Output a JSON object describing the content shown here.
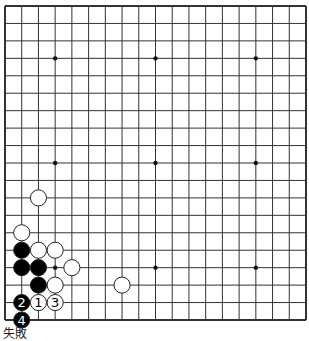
{
  "diagram": {
    "type": "go-board",
    "size": 19,
    "visible_region": "full board",
    "colors": {
      "board": "#ffffff",
      "line": "#333333",
      "black_stone": "#000000",
      "white_stone": "#ffffff",
      "stone_outline": "#222222"
    },
    "hoshi": [
      [
        3,
        3
      ],
      [
        9,
        3
      ],
      [
        15,
        3
      ],
      [
        3,
        9
      ],
      [
        9,
        9
      ],
      [
        15,
        9
      ],
      [
        3,
        15
      ],
      [
        9,
        15
      ],
      [
        15,
        15
      ]
    ],
    "stones": [
      {
        "col": 2,
        "row": 11,
        "color": "white",
        "label": ""
      },
      {
        "col": 1,
        "row": 13,
        "color": "white",
        "label": ""
      },
      {
        "col": 1,
        "row": 14,
        "color": "black",
        "label": ""
      },
      {
        "col": 2,
        "row": 14,
        "color": "white",
        "label": ""
      },
      {
        "col": 3,
        "row": 14,
        "color": "white",
        "label": ""
      },
      {
        "col": 1,
        "row": 15,
        "color": "black",
        "label": ""
      },
      {
        "col": 2,
        "row": 15,
        "color": "black",
        "label": ""
      },
      {
        "col": 4,
        "row": 15,
        "color": "white",
        "label": ""
      },
      {
        "col": 2,
        "row": 16,
        "color": "black",
        "label": ""
      },
      {
        "col": 3,
        "row": 16,
        "color": "white",
        "label": ""
      },
      {
        "col": 7,
        "row": 16,
        "color": "white",
        "label": ""
      },
      {
        "col": 1,
        "row": 17,
        "color": "black",
        "label": "2"
      },
      {
        "col": 2,
        "row": 17,
        "color": "white",
        "label": "1"
      },
      {
        "col": 3,
        "row": 17,
        "color": "white",
        "label": "3"
      },
      {
        "col": 1,
        "row": 18,
        "color": "black",
        "label": "4"
      }
    ]
  },
  "caption": "失敗"
}
